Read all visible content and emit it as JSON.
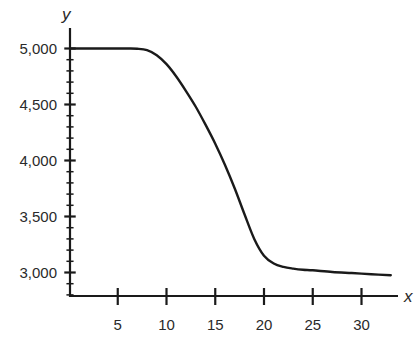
{
  "chart_data": {
    "type": "line",
    "title": "",
    "xlabel": "x",
    "ylabel": "y",
    "xlim": [
      0,
      34
    ],
    "ylim": [
      2800,
      5150
    ],
    "grid": false,
    "legend": null,
    "x_ticks": [
      5,
      10,
      15,
      20,
      25,
      30
    ],
    "x_tick_labels": [
      "5",
      "10",
      "15",
      "20",
      "25",
      "30"
    ],
    "y_major_ticks": [
      3000,
      3500,
      4000,
      4500,
      5000
    ],
    "y_tick_labels": [
      "3,000",
      "3,500",
      "4,000",
      "4,500",
      "5,000"
    ],
    "y_minor_tick_step": 100,
    "series": [
      {
        "name": "y",
        "color": "#1a1a1a",
        "x": [
          0,
          2,
          4,
          6,
          7,
          8,
          9,
          10,
          11,
          12,
          13,
          14,
          15,
          16,
          17,
          18,
          19,
          20,
          21,
          22,
          23,
          24,
          25,
          27,
          29,
          31,
          33
        ],
        "y": [
          5000,
          5000,
          5000,
          5000,
          4998,
          4985,
          4940,
          4860,
          4750,
          4620,
          4480,
          4320,
          4150,
          3960,
          3750,
          3520,
          3300,
          3150,
          3080,
          3050,
          3035,
          3025,
          3020,
          3005,
          2995,
          2985,
          2975
        ]
      }
    ]
  }
}
